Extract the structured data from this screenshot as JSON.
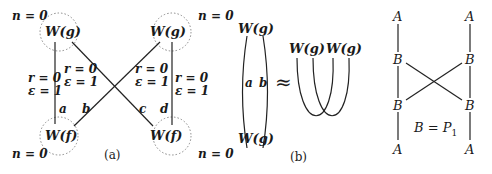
{
  "panel_a": {
    "caption": "(a)",
    "nodes": {
      "top_left": "W(g)",
      "top_right": "W(g)",
      "bottom_left": "W(f)",
      "bottom_right": "W(f)"
    },
    "n_labels": {
      "top_left": "n = 0",
      "top_right": "n = 0",
      "bottom_left": "n = 0",
      "bottom_right": "n = 0"
    },
    "edge_labels": {
      "left_r": "r = 0",
      "left_eps": "ε = 1",
      "cross_left_r": "r = 0",
      "cross_left_eps": "ε = 1",
      "cross_right_r": "r = 0",
      "cross_right_eps": "ε = 1",
      "right_r": "r = 0",
      "right_eps": "ε = 1"
    },
    "edge_names": {
      "a": "a",
      "b": "b",
      "c": "c",
      "d": "d"
    }
  },
  "panel_b": {
    "caption": "(b)",
    "left_top": "W(g)",
    "left_bottom": "W(g)",
    "edge_a": "a",
    "edge_b": "b",
    "approx": "≈",
    "right_node_1": "W(g)",
    "right_node_2": "W(g)"
  },
  "panel_c": {
    "top_left": "A",
    "top_right": "A",
    "mid1_left": "B",
    "mid1_right": "B",
    "mid2_left": "B",
    "mid2_right": "B",
    "bottom_left": "A",
    "bottom_right": "A",
    "equation": "B = P",
    "equation_sub": "1"
  }
}
